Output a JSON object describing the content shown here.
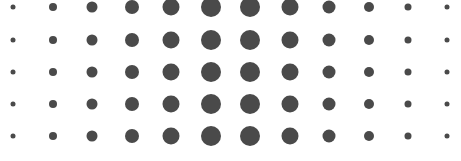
{
  "figure": {
    "background_color": "#ffffff",
    "dot_color": "#4a4a4a",
    "width": 461,
    "height": 161
  },
  "chart_data": {
    "type": "heatmap",
    "title": "",
    "subtitle": "",
    "xlabel": "",
    "ylabel": "",
    "legend": [],
    "annotations": [],
    "grid": false,
    "legend_position": "none",
    "encoding": "dot-area",
    "marker": "circle",
    "color": "#4a4a4a",
    "background": "#ffffff",
    "x": [
      1,
      2,
      3,
      4,
      5,
      6,
      7,
      8,
      9,
      10,
      11,
      12
    ],
    "categories": [
      "1",
      "2",
      "3",
      "4",
      "5",
      "6",
      "7",
      "8",
      "9",
      "10",
      "11",
      "12"
    ],
    "row_labels": [
      "1",
      "2",
      "3",
      "4",
      "5"
    ],
    "xlim": [
      0.5,
      12.5
    ],
    "ylim": [
      0.5,
      5.5
    ],
    "column_centers_px": [
      13,
      52.5,
      92,
      131.5,
      171,
      210.5,
      250,
      289.5,
      329,
      368.5,
      408,
      447
    ],
    "row_centers_px": [
      7,
      40,
      72,
      104,
      136
    ],
    "size_unit": "px-diameter",
    "series": [
      {
        "name": "row-1",
        "values": [
          5,
          8,
          11,
          14,
          17,
          20,
          20,
          17,
          13,
          10,
          7,
          5
        ]
      },
      {
        "name": "row-2",
        "values": [
          5,
          8,
          11,
          14,
          17,
          20,
          20,
          17,
          13,
          10,
          7,
          5
        ]
      },
      {
        "name": "row-3",
        "values": [
          5,
          8,
          11,
          14,
          17,
          20,
          20,
          17,
          13,
          10,
          7,
          5
        ]
      },
      {
        "name": "row-4",
        "values": [
          5,
          8,
          11,
          14,
          17,
          20,
          20,
          17,
          13,
          10,
          7,
          5
        ]
      },
      {
        "name": "row-5",
        "values": [
          5,
          8,
          11,
          14,
          17,
          20,
          20,
          17,
          13,
          10,
          7,
          5
        ]
      }
    ]
  }
}
